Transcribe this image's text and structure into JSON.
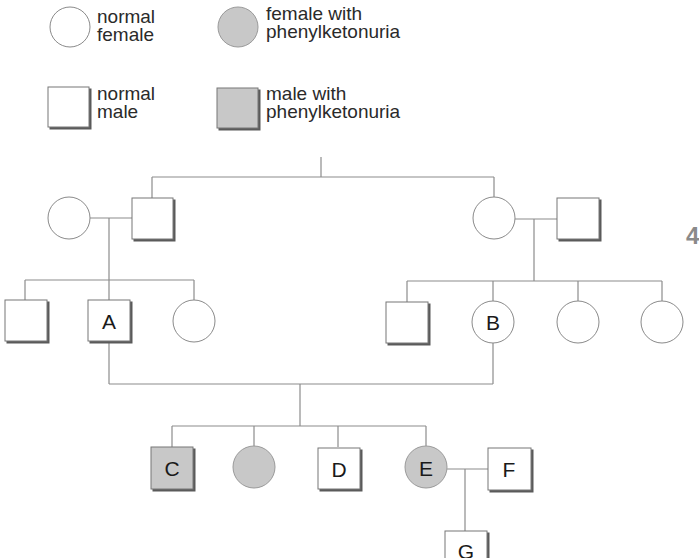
{
  "legend": {
    "normal_female": {
      "line1": "normal",
      "line2": "female",
      "symbol": "circle-empty"
    },
    "affected_female": {
      "line1": "female with",
      "line2": "phenylketonuria",
      "symbol": "circle-filled"
    },
    "normal_male": {
      "line1": "normal",
      "line2": "male",
      "symbol": "square-empty"
    },
    "affected_male": {
      "line1": "male with",
      "line2": "phenylketonuria",
      "symbol": "square-filled"
    }
  },
  "colors": {
    "affected_fill": "#c8c8c8",
    "line": "#8c8c8c",
    "outline": "#555555",
    "shadow": "#6a6a6a"
  },
  "pedigree": {
    "generation_1": [
      {
        "sex": "female",
        "affected": false,
        "label": ""
      },
      {
        "sex": "male",
        "affected": false,
        "label": ""
      },
      {
        "sex": "female",
        "affected": false,
        "label": ""
      },
      {
        "sex": "male",
        "affected": false,
        "label": ""
      }
    ],
    "generation_2": [
      {
        "sex": "male",
        "affected": false,
        "label": ""
      },
      {
        "sex": "male",
        "affected": false,
        "label": "A"
      },
      {
        "sex": "female",
        "affected": false,
        "label": ""
      },
      {
        "sex": "male",
        "affected": false,
        "label": ""
      },
      {
        "sex": "female",
        "affected": false,
        "label": "B"
      },
      {
        "sex": "female",
        "affected": false,
        "label": ""
      },
      {
        "sex": "female",
        "affected": false,
        "label": ""
      }
    ],
    "generation_3": [
      {
        "sex": "male",
        "affected": true,
        "label": "C"
      },
      {
        "sex": "female",
        "affected": true,
        "label": ""
      },
      {
        "sex": "male",
        "affected": false,
        "label": "D"
      },
      {
        "sex": "female",
        "affected": true,
        "label": "E"
      },
      {
        "sex": "male",
        "affected": false,
        "label": "F"
      }
    ],
    "generation_4": [
      {
        "sex": "male",
        "affected": false,
        "label": "G"
      }
    ]
  },
  "labels": {
    "A": "A",
    "B": "B",
    "C": "C",
    "D": "D",
    "E": "E",
    "F": "F",
    "G": "G"
  },
  "page_marker": "4"
}
